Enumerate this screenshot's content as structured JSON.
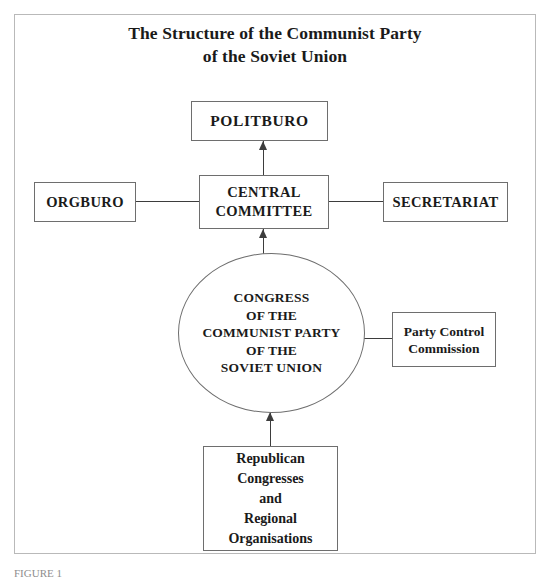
{
  "document": {
    "title_lines": [
      "The Structure of the Communist Party",
      "of the Soviet Union"
    ],
    "caption": "FIGURE 1"
  },
  "diagram": {
    "type": "organisational-hierarchy-chart",
    "nodes": {
      "politburo": {
        "shape": "rectangle",
        "lines": [
          "POLITBURO"
        ]
      },
      "central_committee": {
        "shape": "rectangle",
        "lines": [
          "CENTRAL",
          "COMMITTEE"
        ]
      },
      "orgburo": {
        "shape": "rectangle",
        "lines": [
          "ORGBURO"
        ]
      },
      "secretariat": {
        "shape": "rectangle",
        "lines": [
          "SECRETARIAT"
        ]
      },
      "congress": {
        "shape": "circle",
        "lines": [
          "CONGRESS",
          "OF THE",
          "COMMUNIST PARTY",
          "OF THE",
          "SOVIET UNION"
        ]
      },
      "party_control_commission": {
        "shape": "rectangle",
        "lines": [
          "Party Control",
          "Commission"
        ]
      },
      "republican_congresses": {
        "shape": "rectangle",
        "lines": [
          "Republican",
          "Congresses",
          "and",
          "Regional",
          "Organisations"
        ]
      }
    },
    "connectors": [
      {
        "from": "central_committee",
        "to": "politburo",
        "style": "arrow-up"
      },
      {
        "from": "congress",
        "to": "central_committee",
        "style": "arrow-up"
      },
      {
        "from": "republican_congresses",
        "to": "congress",
        "style": "arrow-up"
      },
      {
        "from": "orgburo",
        "to": "central_committee",
        "style": "line"
      },
      {
        "from": "central_committee",
        "to": "secretariat",
        "style": "line"
      },
      {
        "from": "congress",
        "to": "party_control_commission",
        "style": "line"
      }
    ]
  },
  "colors": {
    "page_background": "#ffffff",
    "frame_border": "#b9b9b9",
    "box_border": "#6e6e6e",
    "connector": "#3d3d3d",
    "text": "#1a1a1a",
    "caption_text": "#8e8e8e"
  }
}
